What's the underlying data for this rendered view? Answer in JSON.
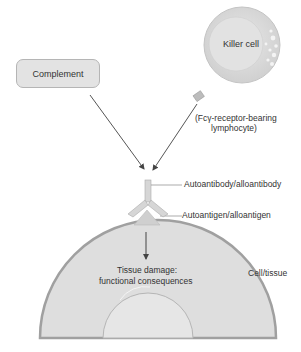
{
  "diagram": {
    "complement_label": "Complement",
    "killer_cell_label": "Killer cell",
    "killer_cell_note_line1": "(Fcγ-receptor-bearing",
    "killer_cell_note_line2": "lymphocyte)",
    "antibody_label": "Autoantibody/alloantibody",
    "antigen_label": "Autoantigen/alloantigen",
    "damage_line1": "Tissue damage:",
    "damage_line2": "functional consequences",
    "cell_label": "Cell/tissue"
  },
  "colors": {
    "cell_fill": "#dcdcdc",
    "cell_border": "#a8a8a8",
    "box_fill": "#e3e3e3",
    "arrow": "#555555"
  }
}
